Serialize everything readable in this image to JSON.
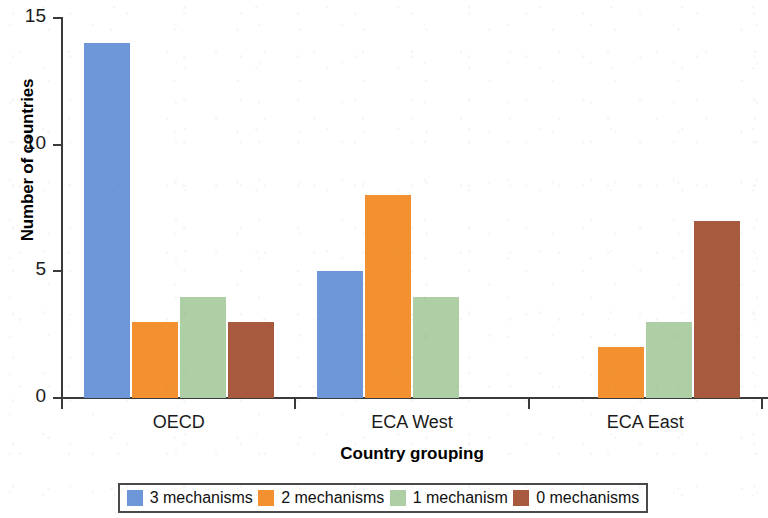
{
  "chart_data": {
    "type": "bar",
    "title": "",
    "subtitle": "",
    "xlabel": "Country grouping",
    "ylabel": "Number of countries",
    "categories": [
      "OECD",
      "ECA West",
      "ECA East"
    ],
    "series": [
      {
        "name": "3 mechanisms",
        "color": "#6e97d9",
        "values": [
          14,
          5,
          0
        ]
      },
      {
        "name": "2 mechanisms",
        "color": "#f3902f",
        "values": [
          3,
          8,
          2
        ]
      },
      {
        "name": "1 mechanism",
        "color": "#aecfa6",
        "values": [
          4,
          4,
          3
        ]
      },
      {
        "name": "0 mechanisms",
        "color": "#a85a3e",
        "values": [
          3,
          0,
          7
        ]
      }
    ],
    "ylim": [
      0,
      15
    ],
    "yticks": [
      0,
      5,
      10,
      15
    ],
    "ytick_labels": [
      "0",
      "5",
      "10",
      "15"
    ],
    "grid": false,
    "legend_position": "bottom",
    "bar_group_mode": "grouped"
  },
  "axes": {
    "y_title": "Number of countries",
    "x_title": "Country grouping",
    "y_tick_labels": [
      "15",
      "10",
      "5",
      "0"
    ],
    "x_tick_labels": [
      "OECD",
      "ECA West",
      "ECA East"
    ]
  },
  "legend": {
    "items": [
      {
        "label": "3 mechanisms",
        "color": "#6e97d9"
      },
      {
        "label": "2 mechanisms",
        "color": "#f3902f"
      },
      {
        "label": "1 mechanism",
        "color": "#aecfa6"
      },
      {
        "label": "0 mechanisms",
        "color": "#a85a3e"
      }
    ]
  },
  "colors": {
    "series_3_mechanisms": "#6e97d9",
    "series_2_mechanisms": "#f3902f",
    "series_1_mechanism": "#aecfa6",
    "series_0_mechanisms": "#a85a3e",
    "axis": "#3a3a3a",
    "text": "#111111",
    "background": "#ffffff"
  }
}
